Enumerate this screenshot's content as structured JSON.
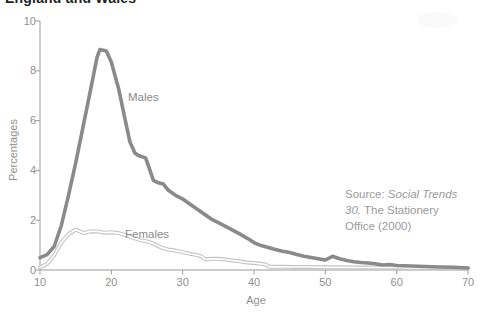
{
  "title": "England and Wales",
  "source_lines": [
    [
      {
        "text": "Source: ",
        "italic": false
      },
      {
        "text": "Social Trends",
        "italic": true
      }
    ],
    [
      {
        "text": "30.",
        "italic": true
      },
      {
        "text": " The Stationery",
        "italic": false
      }
    ],
    [
      {
        "text": "Office (2000)",
        "italic": false
      }
    ]
  ],
  "chart_data": {
    "type": "line",
    "title": "England and Wales",
    "xlabel": "Age",
    "ylabel": "Percentages",
    "xlim": [
      10,
      70
    ],
    "ylim": [
      0,
      10
    ],
    "x_ticks": [
      10,
      20,
      30,
      40,
      50,
      60,
      70
    ],
    "y_ticks": [
      0,
      2,
      4,
      6,
      8,
      10
    ],
    "grid": false,
    "legend_position": "inline-labels-on-plot",
    "axis_color": "#9b9b9b",
    "text_color": "#8f8f8f",
    "series": [
      {
        "name": "Males",
        "color": "#8a8a8a",
        "line_style": "solid",
        "points": [
          [
            10,
            0.5
          ],
          [
            11,
            0.62
          ],
          [
            12,
            0.95
          ],
          [
            13,
            1.8
          ],
          [
            14,
            3.0
          ],
          [
            15,
            4.3
          ],
          [
            16,
            5.7
          ],
          [
            17,
            7.1
          ],
          [
            18,
            8.55
          ],
          [
            18.4,
            8.85
          ],
          [
            19.3,
            8.8
          ],
          [
            20,
            8.35
          ],
          [
            21,
            7.3
          ],
          [
            22,
            5.95
          ],
          [
            22.6,
            5.15
          ],
          [
            23.3,
            4.7
          ],
          [
            23.8,
            4.6
          ],
          [
            24.8,
            4.5
          ],
          [
            25.3,
            4.1
          ],
          [
            25.9,
            3.6
          ],
          [
            26.6,
            3.5
          ],
          [
            27.3,
            3.45
          ],
          [
            28,
            3.2
          ],
          [
            29,
            3.0
          ],
          [
            30,
            2.85
          ],
          [
            31,
            2.65
          ],
          [
            32,
            2.45
          ],
          [
            33,
            2.25
          ],
          [
            34,
            2.05
          ],
          [
            35,
            1.9
          ],
          [
            36,
            1.75
          ],
          [
            37,
            1.6
          ],
          [
            38,
            1.45
          ],
          [
            39,
            1.28
          ],
          [
            40,
            1.1
          ],
          [
            41,
            0.98
          ],
          [
            42,
            0.9
          ],
          [
            43,
            0.82
          ],
          [
            44,
            0.75
          ],
          [
            45,
            0.7
          ],
          [
            46,
            0.62
          ],
          [
            47,
            0.55
          ],
          [
            48,
            0.5
          ],
          [
            49,
            0.45
          ],
          [
            50,
            0.4
          ],
          [
            51,
            0.55
          ],
          [
            52,
            0.45
          ],
          [
            53,
            0.38
          ],
          [
            54,
            0.33
          ],
          [
            55,
            0.3
          ],
          [
            56,
            0.28
          ],
          [
            57,
            0.25
          ],
          [
            58,
            0.2
          ],
          [
            59,
            0.22
          ],
          [
            60,
            0.18
          ],
          [
            62,
            0.16
          ],
          [
            64,
            0.14
          ],
          [
            66,
            0.12
          ],
          [
            68,
            0.11
          ],
          [
            70,
            0.08
          ]
        ]
      },
      {
        "name": "Females",
        "color": "#c4c4c4",
        "line_style": "double-outline-white-core",
        "points": [
          [
            10,
            0.1
          ],
          [
            11,
            0.25
          ],
          [
            12,
            0.6
          ],
          [
            13,
            1.1
          ],
          [
            14,
            1.45
          ],
          [
            15,
            1.62
          ],
          [
            15.6,
            1.55
          ],
          [
            16.2,
            1.48
          ],
          [
            17,
            1.55
          ],
          [
            18,
            1.55
          ],
          [
            19,
            1.5
          ],
          [
            20,
            1.52
          ],
          [
            21,
            1.48
          ],
          [
            22,
            1.4
          ],
          [
            23,
            1.3
          ],
          [
            24,
            1.2
          ],
          [
            25,
            1.15
          ],
          [
            26,
            1.05
          ],
          [
            27,
            0.9
          ],
          [
            28,
            0.82
          ],
          [
            29,
            0.78
          ],
          [
            30,
            0.72
          ],
          [
            31,
            0.65
          ],
          [
            32,
            0.6
          ],
          [
            32.6,
            0.55
          ],
          [
            33.2,
            0.42
          ],
          [
            34,
            0.45
          ],
          [
            35,
            0.45
          ],
          [
            36,
            0.42
          ],
          [
            37,
            0.38
          ],
          [
            38,
            0.35
          ],
          [
            39,
            0.3
          ],
          [
            40,
            0.28
          ],
          [
            41,
            0.25
          ],
          [
            41.6,
            0.22
          ],
          [
            42.2,
            0.13
          ],
          [
            44,
            0.13
          ],
          [
            46,
            0.12
          ],
          [
            48,
            0.12
          ],
          [
            50,
            0.11
          ],
          [
            52,
            0.11
          ],
          [
            54,
            0.1
          ],
          [
            56,
            0.1
          ],
          [
            58,
            0.1
          ],
          [
            60,
            0.1
          ],
          [
            62,
            0.09
          ],
          [
            64,
            0.09
          ],
          [
            66,
            0.08
          ],
          [
            68,
            0.08
          ],
          [
            70,
            0.07
          ]
        ]
      }
    ]
  }
}
